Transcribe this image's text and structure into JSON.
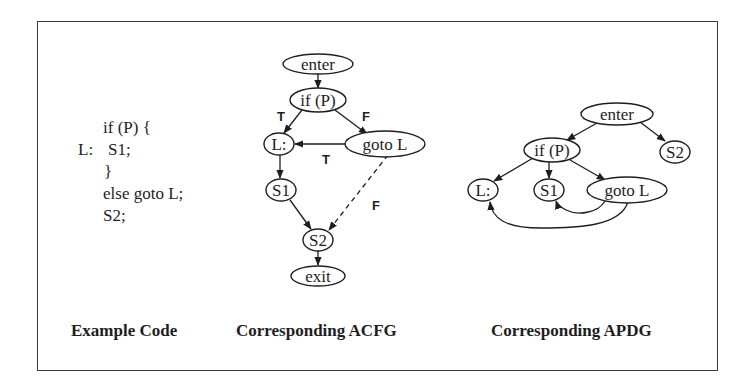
{
  "panels": {
    "code": {
      "caption": "Example Code",
      "lines": [
        {
          "label": "",
          "text": "if (P) {"
        },
        {
          "label": "L:",
          "text": "S1;"
        },
        {
          "label": "",
          "text": "}"
        },
        {
          "label": "",
          "text": "else goto L;"
        },
        {
          "label": "",
          "text": "S2;"
        }
      ]
    },
    "acfg": {
      "caption": "Corresponding ACFG",
      "nodes": {
        "enter": "enter",
        "ifp": "if (P)",
        "L": "L:",
        "goto": "goto L",
        "S1": "S1",
        "S2": "S2",
        "exit": "exit"
      },
      "edge_labels": {
        "ifp_to_L": "T",
        "ifp_to_goto": "F",
        "goto_to_L": "T",
        "goto_to_S2": "F"
      }
    },
    "apdg": {
      "caption": "Corresponding APDG",
      "nodes": {
        "enter": "enter",
        "ifp": "if (P)",
        "S2": "S2",
        "L": "L:",
        "S1": "S1",
        "goto": "goto L"
      }
    }
  }
}
